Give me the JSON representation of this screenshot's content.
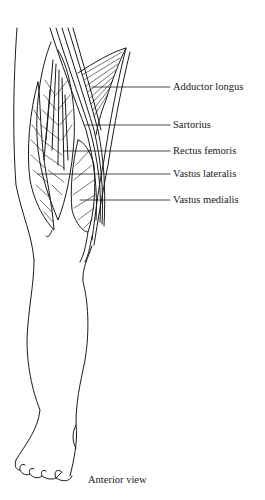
{
  "figure": {
    "caption": "Anterior view",
    "labels": [
      {
        "text": "Adductor longus",
        "x": 173,
        "y": 81,
        "line_from_x": 92,
        "line_y": 87
      },
      {
        "text": "Sartorius",
        "x": 173,
        "y": 119,
        "line_from_x": 85,
        "line_y": 125
      },
      {
        "text": "Rectus femoris",
        "x": 173,
        "y": 145,
        "line_from_x": 63,
        "line_y": 151
      },
      {
        "text": "Vastus lateralis",
        "x": 173,
        "y": 168,
        "line_from_x": 38,
        "line_y": 174
      },
      {
        "text": "Vastus medialis",
        "x": 173,
        "y": 194,
        "line_from_x": 80,
        "line_y": 200
      }
    ],
    "colors": {
      "ink": "#1a1a1a",
      "background": "#ffffff"
    }
  }
}
